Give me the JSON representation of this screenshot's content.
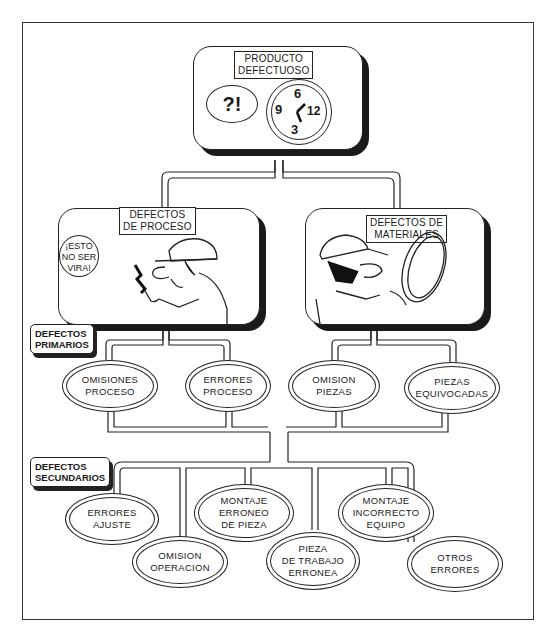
{
  "root": {
    "label_line1": "PRODUCTO",
    "label_line2": "DEFECTUOSO",
    "speech_bubble": "?!",
    "clock_numbers": [
      "6",
      "9",
      "12",
      "3"
    ]
  },
  "categories": [
    {
      "label_line1": "DEFECTOS",
      "label_line2": "DE PROCESO",
      "speech_bubble_lines": [
        "¡ESTO",
        "NO SER",
        "VIRA!"
      ],
      "illustration": "worker-with-broken-tool"
    },
    {
      "label_line1": "DEFECTOS DE",
      "label_line2": "MATERIALES",
      "illustration": "worker-inspecting-part"
    }
  ],
  "level_tags": {
    "primary": {
      "line1": "DEFECTOS",
      "line2": "PRIMARIOS"
    },
    "secondary": {
      "line1": "DEFECTOS",
      "line2": "SECUNDARIOS"
    }
  },
  "primary_defects": [
    {
      "label": "OMISIONES\nPROCESO"
    },
    {
      "label": "ERRORES\nPROCESO"
    },
    {
      "label": "OMISION\nPIEZAS"
    },
    {
      "label": "PIEZAS\nEQUIVOCADAS"
    }
  ],
  "secondary_defects": [
    {
      "label": "ERRORES\nAJUSTE"
    },
    {
      "label": "OMISION\nOPERACION"
    },
    {
      "label": "MONTAJE\nERRONEO\nDE PIEZA"
    },
    {
      "label": "PIEZA\nDE TRABAJO\nERRONEA"
    },
    {
      "label": "MONTAJE\nINCORRECTO\nEQUIPO"
    },
    {
      "label": "OTROS\nERRORES"
    }
  ]
}
